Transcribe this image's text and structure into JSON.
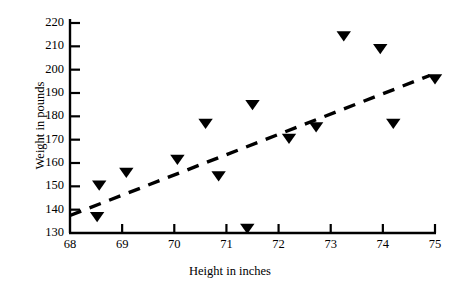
{
  "chart_data": {
    "type": "scatter",
    "title": "",
    "xlabel": "Height in inches",
    "ylabel": "Weight  in  pounds",
    "xlim": [
      68,
      75
    ],
    "ylim": [
      130,
      220
    ],
    "xticks": [
      68,
      69,
      70,
      71,
      72,
      73,
      74,
      75
    ],
    "xticklabels": [
      "68",
      "69",
      "70",
      "71",
      "72",
      "73",
      "74",
      "75"
    ],
    "yticks": [
      130,
      140,
      150,
      160,
      170,
      180,
      190,
      200,
      210,
      220
    ],
    "yticklabels": [
      "130",
      "140",
      "150",
      "160",
      "170",
      "180",
      "190",
      "200",
      "210",
      "220"
    ],
    "grid": false,
    "legend": "none",
    "marker": "triangle-down",
    "marker_color": "#000000",
    "points": [
      {
        "x": 68.52,
        "y": 137
      },
      {
        "x": 68.56,
        "y": 150.5
      },
      {
        "x": 69.08,
        "y": 156
      },
      {
        "x": 70.06,
        "y": 161.5
      },
      {
        "x": 70.6,
        "y": 177
      },
      {
        "x": 70.85,
        "y": 154.5
      },
      {
        "x": 71.4,
        "y": 132
      },
      {
        "x": 71.5,
        "y": 185
      },
      {
        "x": 72.2,
        "y": 170.5
      },
      {
        "x": 72.72,
        "y": 175.5
      },
      {
        "x": 73.25,
        "y": 214.5
      },
      {
        "x": 73.95,
        "y": 209
      },
      {
        "x": 74.2,
        "y": 177
      },
      {
        "x": 75.0,
        "y": 196
      }
    ],
    "trendline": {
      "style": "dashed",
      "color": "#000000",
      "x_start": 68.0,
      "y_start": 137.5,
      "x_end": 74.9,
      "y_end": 197.5
    }
  },
  "axes": {
    "y_title": "Weight  in  pounds",
    "x_title": "Height in inches"
  }
}
